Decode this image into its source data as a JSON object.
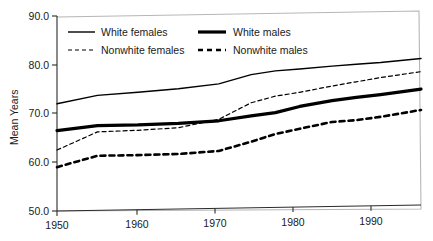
{
  "chart_data": {
    "type": "line",
    "title": "",
    "subtitle": "",
    "xlabel": "",
    "ylabel": "Mean Years",
    "xlim": [
      1950,
      1995
    ],
    "ylim": [
      50.0,
      90.0
    ],
    "ytick_values": [
      50.0,
      60.0,
      70.0,
      80.0,
      90.0
    ],
    "ytick_labels": [
      "50.0",
      "60.0",
      "70.0",
      "80.0",
      "90.0"
    ],
    "xtick_values": [
      1950,
      1960,
      1970,
      1980,
      1990
    ],
    "xtick_labels": [
      "1950",
      "1960",
      "1970",
      "1980",
      "1990"
    ],
    "grid": false,
    "legend_position": "top-left-inside",
    "x": [
      1950,
      1955,
      1960,
      1965,
      1970,
      1974,
      1977,
      1980,
      1984,
      1987,
      1990,
      1995
    ],
    "series": [
      {
        "name": "White females",
        "style": "solid-thin",
        "color": "#000000",
        "values": [
          72.0,
          73.6,
          74.1,
          74.7,
          75.6,
          77.4,
          78.1,
          78.4,
          78.9,
          79.2,
          79.5,
          80.2
        ]
      },
      {
        "name": "White males",
        "style": "solid-thick",
        "color": "#000000",
        "values": [
          66.5,
          67.4,
          67.4,
          67.6,
          68.0,
          68.9,
          69.5,
          70.7,
          71.8,
          72.4,
          72.9,
          73.9
        ]
      },
      {
        "name": "Nonwhite females",
        "style": "dashed-thin",
        "color": "#000000",
        "values": [
          62.5,
          66.1,
          66.3,
          66.7,
          68.3,
          71.6,
          72.9,
          73.6,
          74.8,
          75.6,
          76.4,
          77.5
        ]
      },
      {
        "name": "Nonwhite males",
        "style": "dashed-thick",
        "color": "#000000",
        "values": [
          59.0,
          61.2,
          61.2,
          61.3,
          61.8,
          63.6,
          65.1,
          66.1,
          67.4,
          67.7,
          68.3,
          69.6
        ]
      }
    ],
    "endpoint_values": {
      "White females": {
        "start": 72.0,
        "end": 82.5
      },
      "White males": {
        "start": 66.5,
        "end": 76.2
      },
      "Nonwhite females": {
        "start": 62.5,
        "end": 78.8
      },
      "Nonwhite males": {
        "start": 59.0,
        "end": 70.8
      }
    }
  },
  "axis": {
    "ylabel": "Mean Years",
    "yticks": [
      "90.0",
      "80.0",
      "70.0",
      "60.0",
      "50.0"
    ],
    "xticks": [
      "1950",
      "1960",
      "1970",
      "1980",
      "1990"
    ]
  },
  "legend": {
    "entries": [
      {
        "label": "White females",
        "style": "solid-thin"
      },
      {
        "label": "White males",
        "style": "solid-thick"
      },
      {
        "label": "Nonwhite females",
        "style": "dashed-thin"
      },
      {
        "label": "Nonwhite males",
        "style": "dashed-thick"
      }
    ]
  }
}
